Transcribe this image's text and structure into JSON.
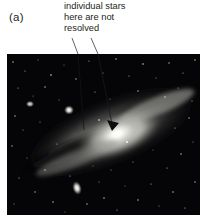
{
  "figure": {
    "panel_label": "(a)",
    "panel_label_name": "panel-letter-a",
    "annotation": {
      "line1": "individual stars",
      "line2": "here are not",
      "line3": "resolved"
    },
    "photo": {
      "subject": "andromeda-galaxy-m31",
      "alt": "Photograph of the Andromeda Galaxy, a tilted spiral galaxy with a bright core, dark dust lanes and a field of foreground stars",
      "background_color": "#050507",
      "core_color": "#f2f2ee",
      "halo_color": "#b9b9b4",
      "dust_lane_color": "#0e0e11",
      "star_color": "#ffffff",
      "companion_galaxy_lower": "m110",
      "companion_galaxy_upper": "m32"
    },
    "leader_lines": {
      "count": 2,
      "color": "#231f20",
      "left_line": {
        "x1": 72,
        "y1": 38,
        "x2": 83,
        "y2": 130,
        "arrowhead": false
      },
      "right_line": {
        "x1": 91,
        "y1": 38,
        "x2": 112,
        "y2": 124,
        "arrowhead": true
      }
    },
    "colors": {
      "page_background": "#ffffff",
      "text": "#231f20"
    }
  }
}
